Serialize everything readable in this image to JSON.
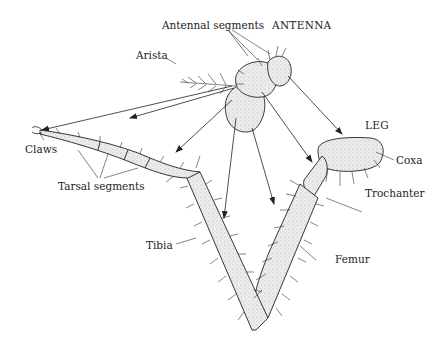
{
  "figure": {
    "headings": {
      "antenna": "ANTENNA",
      "leg": "LEG"
    },
    "labels": {
      "antennal_segments": "Antennal segments",
      "arista": "Arista",
      "claws": "Claws",
      "tarsal_segments": "Tarsal segments",
      "tibia": "Tibia",
      "femur": "Femur",
      "trochanter": "Trochanter",
      "coxa": "Coxa"
    },
    "colors": {
      "ink": "#222222",
      "stipple_fill": "#e6e6e6",
      "background": "#ffffff"
    }
  }
}
